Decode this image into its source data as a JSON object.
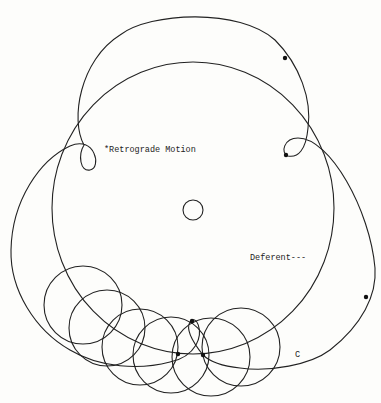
{
  "diagram": {
    "stroke_color": "#222222",
    "background": "#fdfdfb",
    "labels": {
      "retrograde": "*Retrograde Motion",
      "deferent": "Deferent---",
      "c": "C"
    },
    "center_body": {
      "cx": 193,
      "cy": 210,
      "r": 10
    },
    "deferent": {
      "cx": 193,
      "cy": 208,
      "rx": 141,
      "ry": 146
    },
    "epicycles": [
      {
        "cx": 83,
        "cy": 305,
        "r": 39
      },
      {
        "cx": 107,
        "cy": 328,
        "r": 38
      },
      {
        "cx": 140,
        "cy": 347,
        "r": 38
      },
      {
        "cx": 171,
        "cy": 355,
        "r": 38
      },
      {
        "cx": 211,
        "cy": 357,
        "r": 39
      },
      {
        "cx": 241,
        "cy": 347,
        "r": 39
      }
    ],
    "planet_dots": [
      {
        "x": 285,
        "y": 58
      },
      {
        "x": 286,
        "y": 155
      },
      {
        "x": 366,
        "y": 297
      },
      {
        "x": 192,
        "y": 321
      },
      {
        "x": 178,
        "y": 354
      },
      {
        "x": 203,
        "y": 355
      }
    ]
  }
}
